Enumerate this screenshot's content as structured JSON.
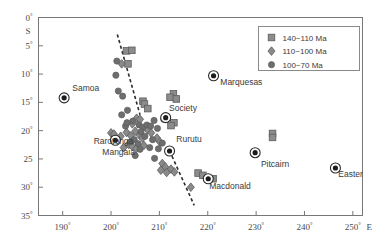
{
  "figure": {
    "axis_corner_label": "S",
    "x_axis_unit": "E"
  },
  "chart_data": {
    "type": "scatter",
    "title": "",
    "xlabel": "E",
    "ylabel": "S",
    "xlim": [
      185,
      252
    ],
    "ylim": [
      0,
      35
    ],
    "y_inverted": true,
    "grid": false,
    "legend_position": "top-right",
    "xticks": [
      "190°",
      "200°",
      "210°",
      "220°",
      "230°",
      "240°",
      "250°"
    ],
    "xtick_values": [
      190,
      200,
      210,
      220,
      230,
      240,
      250
    ],
    "yticks": [
      "0°",
      "5°",
      "10°",
      "15°",
      "20°",
      "25",
      "30°",
      "35°"
    ],
    "ytick_values": [
      0,
      5,
      10,
      15,
      20,
      25,
      30,
      35
    ],
    "legend": [
      {
        "label": "140~110 Ma",
        "marker": "square",
        "color": "#8c8c8c"
      },
      {
        "label": "110~100 Ma",
        "marker": "diamond",
        "color": "#8c8c8c"
      },
      {
        "label": "100~70 Ma",
        "marker": "circle",
        "color": "#6e6e6e"
      }
    ],
    "annotations": [
      {
        "text": "Samoa",
        "x": 192.0,
        "y": 13.0
      },
      {
        "text": "Marquesas",
        "x": 222.6,
        "y": 12.0
      },
      {
        "text": "Society",
        "x": 212.0,
        "y": 16.6
      },
      {
        "text": "Rarotonga",
        "x": 196.4,
        "y": 22.3
      },
      {
        "text": "Mangaia",
        "x": 198.2,
        "y": 24.3
      },
      {
        "text": "Rurutu",
        "x": 213.5,
        "y": 22.0
      },
      {
        "text": "Pitcairn",
        "x": 231.0,
        "y": 26.4
      },
      {
        "text": "Easter",
        "x": 247.0,
        "y": 28.2
      },
      {
        "text": "Macdonald",
        "x": 220.3,
        "y": 30.4
      }
    ],
    "hotspots": [
      {
        "name": "Samoa",
        "x": 190.3,
        "y": 14.2
      },
      {
        "name": "Marquesas",
        "x": 221.2,
        "y": 10.3
      },
      {
        "name": "Society",
        "x": 211.3,
        "y": 17.7
      },
      {
        "name": "Rarotonga",
        "x": 200.9,
        "y": 21.7
      },
      {
        "name": "Rurutu",
        "x": 212.1,
        "y": 23.6
      },
      {
        "name": "Macdonald",
        "x": 220.1,
        "y": 28.5
      },
      {
        "name": "Pitcairn",
        "x": 229.8,
        "y": 23.9
      },
      {
        "name": "Easter",
        "x": 246.4,
        "y": 26.6
      }
    ],
    "series": [
      {
        "name": "140~110 Ma",
        "marker": "square",
        "points": [
          [
            203.2,
            5.9
          ],
          [
            204.3,
            5.8
          ],
          [
            203.5,
            8.2
          ],
          [
            212.9,
            13.5
          ],
          [
            212.2,
            14.1
          ],
          [
            213.5,
            14.4
          ],
          [
            206.6,
            14.8
          ],
          [
            206.9,
            15.3
          ],
          [
            207.6,
            16.1
          ],
          [
            213.0,
            18.6
          ],
          [
            212.4,
            19.1
          ],
          [
            218.0,
            27.5
          ],
          [
            219.0,
            27.9
          ],
          [
            221.1,
            28.5
          ],
          [
            233.4,
            20.5
          ],
          [
            233.4,
            21.2
          ]
        ]
      },
      {
        "name": "110~100 Ma",
        "marker": "diamond",
        "points": [
          [
            202.2,
            8.2
          ],
          [
            205.3,
            17.8
          ],
          [
            206.0,
            18.0
          ],
          [
            204.4,
            18.8
          ],
          [
            200.0,
            20.4
          ],
          [
            200.6,
            20.6
          ],
          [
            201.2,
            21.5
          ],
          [
            202.0,
            21.0
          ],
          [
            203.2,
            20.3
          ],
          [
            204.1,
            20.9
          ],
          [
            205.0,
            20.1
          ],
          [
            205.9,
            20.8
          ],
          [
            206.5,
            21.3
          ],
          [
            203.6,
            22.4
          ],
          [
            204.4,
            22.8
          ],
          [
            205.2,
            23.2
          ],
          [
            202.6,
            23.0
          ],
          [
            206.8,
            22.6
          ],
          [
            207.5,
            19.8
          ],
          [
            208.3,
            20.4
          ],
          [
            209.5,
            21.3
          ],
          [
            210.1,
            22.0
          ],
          [
            210.6,
            25.8
          ],
          [
            211.2,
            26.4
          ],
          [
            210.3,
            27.0
          ],
          [
            211.5,
            27.4
          ],
          [
            212.4,
            26.8
          ],
          [
            213.1,
            27.3
          ],
          [
            216.5,
            30.0
          ]
        ]
      },
      {
        "name": "100~70 Ma",
        "marker": "circle",
        "points": [
          [
            201.2,
            7.7
          ],
          [
            201.0,
            10.2
          ],
          [
            201.5,
            13.0
          ],
          [
            202.4,
            13.9
          ],
          [
            203.4,
            16.4
          ],
          [
            204.5,
            18.3
          ],
          [
            203.0,
            19.2
          ],
          [
            205.8,
            19.0
          ],
          [
            206.6,
            19.4
          ],
          [
            207.4,
            19.0
          ],
          [
            208.2,
            19.2
          ],
          [
            206.2,
            20.2
          ],
          [
            207.0,
            21.0
          ],
          [
            204.8,
            21.6
          ],
          [
            205.6,
            22.3
          ],
          [
            203.3,
            18.6
          ],
          [
            208.9,
            18.2
          ],
          [
            209.6,
            19.6
          ],
          [
            208.6,
            21.6
          ],
          [
            209.8,
            23.2
          ],
          [
            210.6,
            22.2
          ],
          [
            210.9,
            18.0
          ],
          [
            202.2,
            17.2
          ],
          [
            204.0,
            22.0
          ],
          [
            206.0,
            23.3
          ],
          [
            205.0,
            24.4
          ],
          [
            208.0,
            23.0
          ],
          [
            209.0,
            24.9
          ]
        ]
      }
    ],
    "dashed_lines": [
      {
        "x1": 201.3,
        "y1": 3.0,
        "x2": 206.0,
        "y2": 17.2
      },
      {
        "x1": 212.6,
        "y1": 24.5,
        "x2": 217.2,
        "y2": 33.2
      }
    ]
  }
}
